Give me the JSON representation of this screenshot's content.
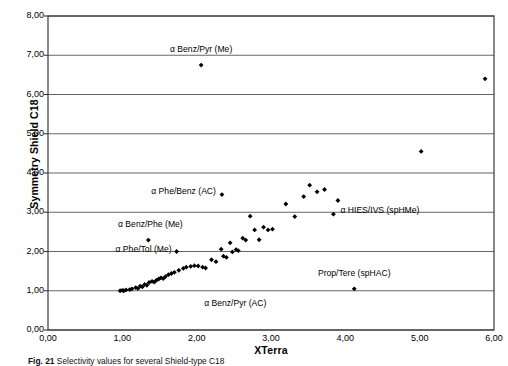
{
  "chart_data": {
    "type": "scatter",
    "title": "",
    "xlabel": "XTerra",
    "ylabel": "Symmetry Shield C18",
    "xlim": [
      0,
      6
    ],
    "ylim": [
      0,
      8
    ],
    "xticks": [
      "0,00",
      "1,00",
      "2,00",
      "3,00",
      "4,00",
      "5,00",
      "6,00"
    ],
    "xtick_values": [
      0,
      1,
      2,
      3,
      4,
      5,
      6
    ],
    "yticks": [
      "0,00",
      "1,00",
      "2,00",
      "3,00",
      "4,00",
      "5,00",
      "6,00",
      "7,00",
      "8,00"
    ],
    "ytick_values": [
      0,
      1,
      2,
      3,
      4,
      5,
      6,
      7,
      8
    ],
    "grid": "horizontal",
    "legend": "none",
    "marker": "filled-diamond",
    "marker_color": "#000000",
    "points": [
      [
        0.97,
        1.0
      ],
      [
        1.0,
        1.01
      ],
      [
        1.02,
        1.0
      ],
      [
        1.05,
        1.02
      ],
      [
        1.1,
        1.03
      ],
      [
        1.13,
        1.05
      ],
      [
        1.18,
        1.08
      ],
      [
        1.21,
        1.06
      ],
      [
        1.24,
        1.12
      ],
      [
        1.27,
        1.1
      ],
      [
        1.3,
        1.16
      ],
      [
        1.33,
        1.14
      ],
      [
        1.36,
        1.21
      ],
      [
        1.4,
        1.24
      ],
      [
        1.43,
        1.22
      ],
      [
        1.46,
        1.27
      ],
      [
        1.49,
        1.3
      ],
      [
        1.52,
        1.33
      ],
      [
        1.55,
        1.31
      ],
      [
        1.58,
        1.36
      ],
      [
        1.62,
        1.41
      ],
      [
        1.66,
        1.44
      ],
      [
        1.7,
        1.47
      ],
      [
        1.76,
        1.52
      ],
      [
        1.82,
        1.57
      ],
      [
        1.86,
        1.6
      ],
      [
        1.92,
        1.62
      ],
      [
        1.97,
        1.64
      ],
      [
        2.02,
        1.63
      ],
      [
        2.08,
        1.6
      ],
      [
        2.12,
        1.58
      ],
      [
        2.2,
        1.79
      ],
      [
        2.26,
        1.74
      ],
      [
        2.33,
        2.06
      ],
      [
        2.36,
        1.88
      ],
      [
        2.4,
        1.85
      ],
      [
        2.45,
        2.22
      ],
      [
        2.48,
        1.99
      ],
      [
        2.53,
        2.05
      ],
      [
        2.56,
        2.02
      ],
      [
        2.62,
        2.34
      ],
      [
        2.66,
        2.29
      ],
      [
        2.72,
        2.9
      ],
      [
        2.78,
        2.55
      ],
      [
        2.84,
        2.3
      ],
      [
        2.9,
        2.62
      ],
      [
        2.96,
        2.55
      ],
      [
        3.02,
        2.57
      ],
      [
        3.2,
        3.21
      ],
      [
        3.32,
        2.89
      ],
      [
        3.44,
        3.4
      ],
      [
        3.52,
        3.69
      ],
      [
        3.62,
        3.52
      ],
      [
        3.72,
        3.58
      ],
      [
        3.84,
        2.95
      ],
      [
        3.9,
        3.3
      ],
      [
        4.12,
        1.05
      ],
      [
        5.02,
        4.55
      ],
      [
        5.88,
        6.4
      ],
      [
        2.06,
        6.75
      ],
      [
        2.34,
        3.45
      ],
      [
        1.35,
        2.29
      ],
      [
        1.73,
        2.0
      ]
    ],
    "annotations": [
      {
        "text": "α Benz/Pyr (Me)",
        "x": 2.06,
        "y": 6.75,
        "align": "center",
        "dx": 0,
        "dy": -16
      },
      {
        "text": "α Phe/Benz (AC)",
        "x": 2.34,
        "y": 3.45,
        "align": "right",
        "dx": -6,
        "dy": -4
      },
      {
        "text": "α HIES/IVS (spHMe)",
        "x": 3.84,
        "y": 2.95,
        "align": "left",
        "dx": 7,
        "dy": -4
      },
      {
        "text": "α Benz/Phe (Me)",
        "x": 1.35,
        "y": 2.29,
        "align": "center",
        "dx": 2,
        "dy": -16
      },
      {
        "text": "α Phe/Tol (Me)",
        "x": 1.73,
        "y": 2.0,
        "align": "right",
        "dx": -5,
        "dy": -3
      },
      {
        "text": "α Benz/Pyr (AC)",
        "x": 2.02,
        "y": 1.0,
        "align": "left",
        "dx": 6,
        "dy": 12
      },
      {
        "text": "Prop/Tere (spHAC)",
        "x": 4.12,
        "y": 1.05,
        "align": "center",
        "dx": 0,
        "dy": -16
      }
    ]
  },
  "caption": {
    "figure_number": "Fig. 21",
    "text": "Selectivity values for several Shield-type C18"
  }
}
